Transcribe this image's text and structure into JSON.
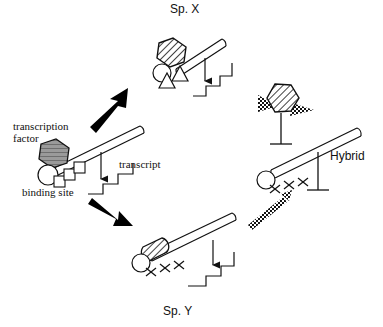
{
  "figure": {
    "background_color": "#ffffff",
    "line_color": "#111111",
    "arrow_color": "#000000"
  },
  "labels": {
    "species_x": "Sp. X",
    "species_y": "Sp. Y",
    "hybrid": "Hybrid",
    "transcription_factor_line1": "transcription",
    "transcription_factor_line2": "factor",
    "binding_site": "binding site",
    "transcript": "transcript"
  },
  "panels": [
    {
      "id": "parent",
      "name": "parental-template-panel",
      "label": "",
      "transcription_factor": {
        "shape": "hexagon",
        "fill": "gray-horizontal-lines",
        "fill_color": "#8e8e8e"
      },
      "cofactors": [
        "circle",
        "square",
        "square",
        "square"
      ],
      "dna_marks": "none",
      "transcript_produced": true,
      "transcript_symbol": "staircase"
    },
    {
      "id": "sp-x",
      "name": "species-x-panel",
      "label": "Sp. X",
      "transcription_factor": {
        "shape": "hexagon",
        "fill": "diagonal-hatch",
        "fill_color": "#ffffff"
      },
      "cofactors": [
        "circle",
        "triangle",
        "triangle"
      ],
      "dna_marks": "none",
      "transcript_produced": true,
      "transcript_symbol": "staircase"
    },
    {
      "id": "sp-y",
      "name": "species-y-panel",
      "label": "Sp. Y",
      "transcription_factor": {
        "shape": "rounded-hatched-block",
        "fill": "diagonal-hatch",
        "fill_color": "#ffffff"
      },
      "cofactors": [
        "circle"
      ],
      "dna_marks": "x-x-x",
      "transcript_produced": true,
      "transcript_symbol": "staircase"
    },
    {
      "id": "hybrid",
      "name": "hybrid-panel",
      "label": "Hybrid",
      "transcription_factor": {
        "shape": "hexagon-with-wings",
        "fill": "diagonal-hatch",
        "wing_fill": "checkered",
        "fill_color": "#ffffff"
      },
      "cofactors": [
        "circle"
      ],
      "dna_marks": "x-x-x",
      "transcript_produced": false,
      "transcript_symbol": "blocked-t-bar"
    }
  ],
  "arrows": [
    {
      "name": "arrow-to-species-x",
      "style": "solid-black",
      "direction": "up-right"
    },
    {
      "name": "arrow-to-species-y",
      "style": "solid-black",
      "direction": "down-right"
    },
    {
      "name": "arrow-species-y-to-hybrid",
      "style": "checkered",
      "direction": "up-right"
    },
    {
      "name": "transcription-arrow-parent",
      "style": "thin-down-arrow",
      "direction": "down"
    },
    {
      "name": "transcription-arrow-species-x",
      "style": "thin-down-arrow",
      "direction": "down"
    },
    {
      "name": "transcription-arrow-species-y",
      "style": "thin-down-arrow",
      "direction": "down"
    },
    {
      "name": "inhibition-bar-hybrid-factor",
      "style": "t-bar",
      "direction": "down"
    },
    {
      "name": "inhibition-bar-hybrid-transcript",
      "style": "t-bar",
      "direction": "down"
    }
  ]
}
